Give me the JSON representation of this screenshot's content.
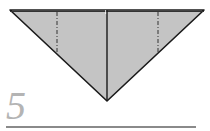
{
  "diagram": {
    "type": "origami-step",
    "step_number": "5",
    "paper_color": "#c4c4c4",
    "edge_color": "#1a1a1a",
    "rule_color": "#8a8a8a",
    "step_color": "#b4b4b4",
    "shape": "inverted-triangle",
    "vertices": {
      "top_left": [
        10,
        10
      ],
      "top_right": [
        204,
        10
      ],
      "bottom_tip": [
        107,
        101
      ]
    },
    "center_crease": {
      "x": 107,
      "y1": 10,
      "y2": 101,
      "style": "solid"
    },
    "fold_lines": [
      {
        "x": 57,
        "y1": 12,
        "y2": 53,
        "style": "dash-dot",
        "label": "mountain-fold-left"
      },
      {
        "x": 158,
        "y1": 12,
        "y2": 53,
        "style": "dash-dot",
        "label": "mountain-fold-right"
      }
    ]
  }
}
